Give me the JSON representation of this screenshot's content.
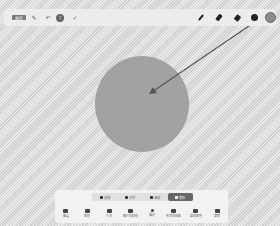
{
  "topbar": {
    "left": [
      {
        "name": "mode-label",
        "label": "画布"
      },
      {
        "name": "pin-icon",
        "glyph": "✎"
      },
      {
        "name": "undo-icon",
        "glyph": "↶"
      },
      {
        "name": "help-icon",
        "glyph": "?"
      },
      {
        "name": "redo-icon",
        "glyph": "✓"
      }
    ],
    "right": [
      {
        "name": "pen-thin-icon"
      },
      {
        "name": "pen-medium-icon"
      },
      {
        "name": "pen-thick-icon"
      },
      {
        "name": "brush-dot-icon"
      },
      {
        "name": "color-picker"
      }
    ]
  },
  "canvas": {
    "shape": {
      "type": "circle",
      "cx": 142,
      "cy": 104,
      "r": 47,
      "fill": "#9e9e9e"
    },
    "arrow": {
      "x1": 268,
      "y1": 13,
      "x2": 150,
      "y2": 93,
      "color": "#555555"
    }
  },
  "panel": {
    "modes": [
      {
        "label": "画笔",
        "active": false
      },
      {
        "label": "形状",
        "active": false
      },
      {
        "label": "橡皮",
        "active": false
      },
      {
        "label": "箭头",
        "active": true
      }
    ],
    "tools": [
      {
        "label": "图层"
      },
      {
        "label": "矩形"
      },
      {
        "label": "文本"
      },
      {
        "label": "图片和贴纸"
      },
      {
        "label": "描边"
      },
      {
        "label": "形状和线条"
      },
      {
        "label": "填充颜色"
      },
      {
        "label": "清除"
      }
    ]
  }
}
